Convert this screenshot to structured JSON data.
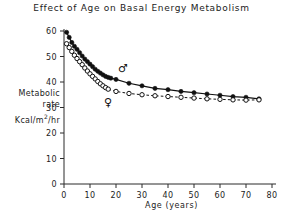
{
  "chart_data": {
    "type": "line",
    "title": "Effect of Age on Basal Energy Metabolism",
    "xlabel": "Age (years)",
    "ylabel": "Metabolic rate Kcal/m2/hr",
    "ylabel_line1": "Metabolic",
    "ylabel_line2": "rate",
    "ylabel_units": "Kcal/m",
    "ylabel_units_sup": "2",
    "ylabel_units_tail": "/hr",
    "xlim": [
      0,
      80
    ],
    "ylim": [
      0,
      60
    ],
    "xticks": [
      0,
      10,
      20,
      30,
      40,
      50,
      60,
      70,
      80
    ],
    "yticks": [
      0,
      10,
      20,
      30,
      40,
      50,
      60
    ],
    "xtick_labels": [
      "0",
      "10",
      "20",
      "30",
      "40",
      "50",
      "60",
      "70",
      "80"
    ],
    "ytick_labels": [
      "0",
      "10",
      "20",
      "30",
      "40",
      "50",
      "60"
    ],
    "grid": false,
    "legend_position": "inline-annotations",
    "annotations": [
      {
        "text": "♂",
        "name": "male-symbol",
        "x": 21,
        "y": 44
      },
      {
        "text": "♀",
        "name": "female-symbol",
        "x": 16,
        "y": 31
      }
    ],
    "series": [
      {
        "name": "Male",
        "symbol": "♂",
        "marker": "filled-circle",
        "linestyle": "solid",
        "color": "#111111",
        "x": [
          1,
          2,
          3,
          4,
          5,
          6,
          7,
          8,
          9,
          10,
          11,
          12,
          13,
          14,
          15,
          16,
          17,
          18,
          20,
          25,
          30,
          35,
          40,
          45,
          50,
          55,
          60,
          65,
          70,
          75
        ],
        "y": [
          59.5,
          57.5,
          55.5,
          54.0,
          52.8,
          51.5,
          50.2,
          49.0,
          48.0,
          47.0,
          46.0,
          45.0,
          44.2,
          43.5,
          42.8,
          42.2,
          41.8,
          41.5,
          41.0,
          39.5,
          38.5,
          37.5,
          37.0,
          36.3,
          35.8,
          35.3,
          34.8,
          34.3,
          34.0,
          33.4
        ]
      },
      {
        "name": "Female",
        "symbol": "♀",
        "marker": "open-circle",
        "linestyle": "dashed",
        "color": "#111111",
        "x": [
          1,
          2,
          3,
          4,
          5,
          6,
          7,
          8,
          9,
          10,
          11,
          12,
          13,
          14,
          15,
          16,
          17,
          20,
          25,
          30,
          35,
          40,
          45,
          50,
          55,
          60,
          65,
          70,
          75
        ],
        "y": [
          55.0,
          53.5,
          52.0,
          50.5,
          49.2,
          48.0,
          46.8,
          45.5,
          44.3,
          43.2,
          42.2,
          41.2,
          40.2,
          39.3,
          38.5,
          37.8,
          37.2,
          36.3,
          35.5,
          35.0,
          34.6,
          34.3,
          34.0,
          33.7,
          33.4,
          33.2,
          33.0,
          32.9,
          33.0
        ]
      }
    ]
  }
}
